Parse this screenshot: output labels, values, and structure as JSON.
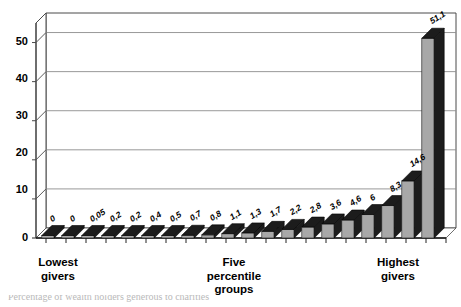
{
  "chart_data": {
    "type": "bar",
    "title": "",
    "subtitle": "",
    "xlabel": "Five percentile groups",
    "ylabel": "",
    "ylim": [
      0,
      55
    ],
    "yticks": [
      0,
      10,
      20,
      30,
      40,
      50
    ],
    "ytick_labels": [
      "0",
      "10",
      "20",
      "30",
      "40",
      "50"
    ],
    "grid": true,
    "grid_axis": "y",
    "legend": false,
    "legend_position": "none",
    "three_d": true,
    "decimal_separator": ",",
    "categories": [
      "1",
      "2",
      "3",
      "4",
      "5",
      "6",
      "7",
      "8",
      "9",
      "10",
      "11",
      "12",
      "13",
      "14",
      "15",
      "16",
      "17",
      "18",
      "19",
      "20"
    ],
    "values": [
      0,
      0,
      0.05,
      0.2,
      0.2,
      0.4,
      0.5,
      0.7,
      0.8,
      1.1,
      1.3,
      1.7,
      2.2,
      2.8,
      3.6,
      4.6,
      6,
      8.3,
      14.6,
      51.1
    ],
    "data_labels": [
      "0",
      "0",
      "0,05",
      "0,2",
      "0,2",
      "0,4",
      "0,5",
      "0,7",
      "0,8",
      "1,1",
      "1,3",
      "1,7",
      "2,2",
      "2,8",
      "3,6",
      "4,6",
      "6",
      "8,3",
      "14,6",
      "51,1"
    ],
    "annotations": [
      {
        "text": "Lowest\ngivers",
        "position": "left"
      },
      {
        "text": "Five\npercentile\ngroups",
        "position": "center"
      },
      {
        "text": "Highest\ngivers",
        "position": "right"
      }
    ],
    "colors": {
      "bar_face": "#a8a8a8",
      "bar_top": "#1c1c1c",
      "bar_side": "#1c1c1c",
      "axis": "#4a4a4a",
      "grid": "#8c8c8c",
      "text": "#000000",
      "background": "#ffffff"
    }
  },
  "axis": {
    "y_labels": [
      "50",
      "40",
      "30",
      "20",
      "10",
      "0"
    ]
  },
  "x_captions": {
    "lowest": "Lowest\ngivers",
    "middle": "Five\npercentile\ngroups",
    "highest": "Highest\ngivers"
  },
  "footer": {
    "caption_fragment": "Percentage of wealth holders generous to charities"
  }
}
